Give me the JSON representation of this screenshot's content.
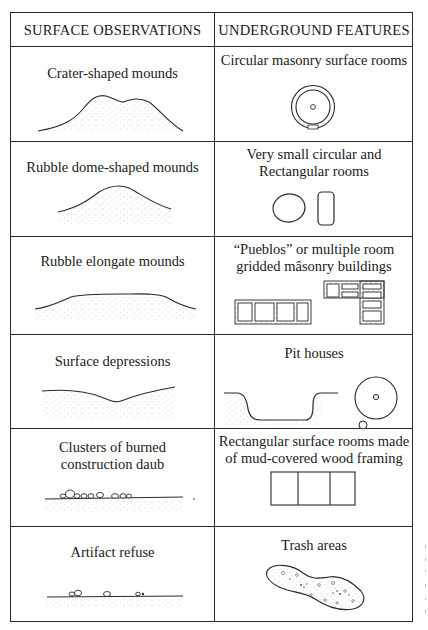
{
  "header": {
    "left": "SURFACE OBSERVATIONS",
    "right": "UNDERGROUND FEATURES"
  },
  "rows": [
    {
      "surface": "Crater-shaped mounds",
      "surface_icon": "crater-mound-profile",
      "underground": "Circular masonry surface rooms",
      "underground_icon": "circular-masonry-room-plan"
    },
    {
      "surface": "Rubble dome-shaped mounds",
      "surface_icon": "dome-mound-profile",
      "underground_line1": "Very small circular and",
      "underground_line2": "Rectangular rooms",
      "underground_icon": "small-circular-and-rectangular-rooms-plan"
    },
    {
      "surface": "Rubble elongate mounds",
      "surface_icon": "elongate-mound-profile",
      "underground_line1": "“Pueblos” or multiple room",
      "underground_line2": "gridded mâsonry buildings",
      "underground_icon": "gridded-masonry-pueblo-plan"
    },
    {
      "surface": "Surface depressions",
      "surface_icon": "depression-profile",
      "underground": "Pit houses",
      "underground_icon": "pit-house-section-and-plan"
    },
    {
      "surface_line1": "Clusters of burned",
      "surface_line2": "construction daub",
      "surface_icon": "burned-daub-clusters-profile",
      "underground_line1": "Rectangular surface rooms made",
      "underground_line2": "of mud-covered wood framing",
      "underground_icon": "three-room-rectangular-plan"
    },
    {
      "surface": "Artifact refuse",
      "surface_icon": "artifact-refuse-profile",
      "underground": "Trash areas",
      "underground_icon": "trash-area-plan"
    }
  ],
  "colors": {
    "ink": "#2a2a2a",
    "stipple": "#8a8a8a",
    "paper": "#ffffff"
  }
}
